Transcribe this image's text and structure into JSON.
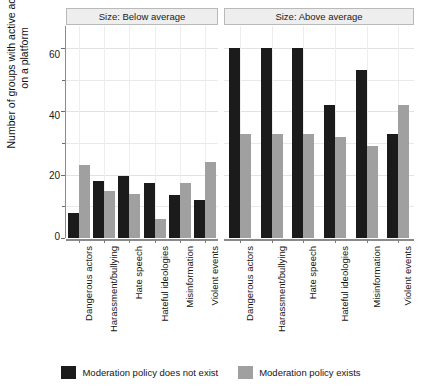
{
  "chart_data": {
    "type": "bar",
    "title": "",
    "xlabel": "",
    "ylabel": "Number of groups with active accounts on a platform",
    "ylim": [
      0,
      67
    ],
    "yticks": [
      0,
      20,
      40,
      60
    ],
    "yticks_minor": [
      10,
      30,
      50
    ],
    "grid": true,
    "legend_position": "bottom",
    "categories": [
      "Dangerous actors",
      "Harassment/bullying",
      "Hate speech",
      "Hateful ideologies",
      "Misinformation",
      "Violent events"
    ],
    "facets": [
      {
        "label": "Size: Below average",
        "series": [
          {
            "name": "Moderation policy does not exist",
            "color": "#1b1b1b",
            "values": [
              8,
              18,
              19.5,
              17.5,
              13.5,
              12
            ]
          },
          {
            "name": "Moderation policy exists",
            "color": "#a0a0a0",
            "values": [
              23,
              15,
              14,
              6,
              17.5,
              24
            ]
          }
        ]
      },
      {
        "label": "Size: Above average",
        "series": [
          {
            "name": "Moderation policy does not exist",
            "color": "#1b1b1b",
            "values": [
              60,
              60,
              60,
              42,
              53,
              33
            ]
          },
          {
            "name": "Moderation policy exists",
            "color": "#a0a0a0",
            "values": [
              33,
              33,
              33,
              32,
              29,
              42
            ]
          }
        ]
      }
    ],
    "legend": [
      {
        "label": "Moderation policy does not exist",
        "color": "#1b1b1b"
      },
      {
        "label": "Moderation policy exists",
        "color": "#a0a0a0"
      }
    ]
  },
  "axis": {
    "y_title": "Number of groups with active accounts on a platform",
    "y_title_line1": "Number of groups with active accounts",
    "y_title_line2": "on a platform",
    "tick_60": "60",
    "tick_40": "40",
    "tick_20": "20",
    "tick_0": "0"
  },
  "strips": {
    "left": "Size: Below average",
    "right": "Size: Above average"
  },
  "categories": {
    "c0": "Dangerous actors",
    "c1": "Harassment/bullying",
    "c2": "Hate speech",
    "c3": "Hateful ideologies",
    "c4": "Misinformation",
    "c5": "Violent events"
  },
  "legend": {
    "item0": "Moderation policy does not exist",
    "item1": "Moderation policy exists"
  }
}
